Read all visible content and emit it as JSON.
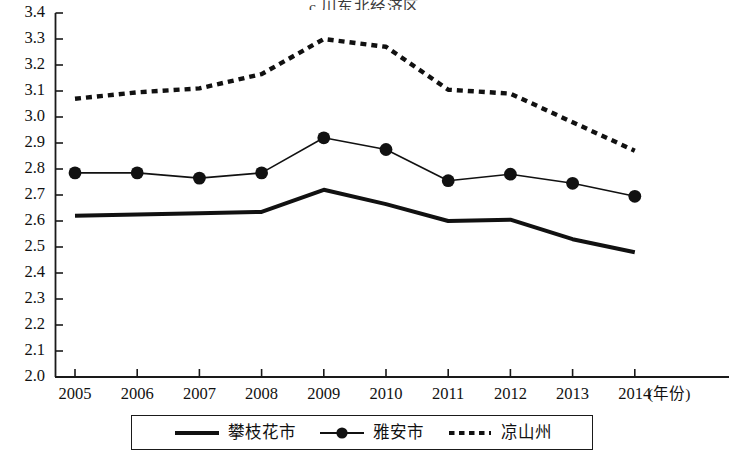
{
  "chart_data": {
    "type": "line",
    "title": "c  川东北经济区",
    "xlabel": "(年份)",
    "ylabel": "",
    "categories": [
      "2005",
      "2006",
      "2007",
      "2008",
      "2009",
      "2010",
      "2011",
      "2012",
      "2013",
      "2014"
    ],
    "x": [
      2005,
      2006,
      2007,
      2008,
      2009,
      2010,
      2011,
      2012,
      2013,
      2014
    ],
    "ylim": [
      2.0,
      3.4
    ],
    "ytick_labels": [
      "3.4",
      "3.3",
      "3.2",
      "3.1",
      "3.0",
      "2.9",
      "2.8",
      "2.7",
      "2.6",
      "2.5",
      "2.4",
      "2.3",
      "2.2",
      "2.1",
      "2.0"
    ],
    "ytick_values": [
      3.4,
      3.3,
      3.2,
      3.1,
      3.0,
      2.9,
      2.8,
      2.7,
      2.6,
      2.5,
      2.4,
      2.3,
      2.2,
      2.1,
      2.0
    ],
    "ytick_step": 0.1,
    "grid": false,
    "legend_position": "bottom",
    "series": [
      {
        "name": "攀枝花市",
        "style": "solid-thick",
        "marker": "none",
        "color": "#111111",
        "values": [
          2.62,
          2.625,
          2.63,
          2.635,
          2.72,
          2.665,
          2.6,
          2.605,
          2.53,
          2.48
        ]
      },
      {
        "name": "雅安市",
        "style": "solid-thin",
        "marker": "filled-circle",
        "color": "#111111",
        "values": [
          2.785,
          2.785,
          2.765,
          2.785,
          2.92,
          2.875,
          2.755,
          2.78,
          2.745,
          2.695
        ]
      },
      {
        "name": "凉山州",
        "style": "dotted",
        "marker": "none",
        "color": "#111111",
        "values": [
          3.07,
          3.095,
          3.11,
          3.165,
          3.3,
          3.27,
          3.105,
          3.09,
          2.98,
          2.87
        ]
      }
    ]
  },
  "legend": {
    "items": [
      {
        "label": "攀枝花市",
        "swatch": "solid-thick-line-swatch"
      },
      {
        "label": "雅安市",
        "swatch": "circle-marker-line-swatch"
      },
      {
        "label": "凉山州",
        "swatch": "dotted-line-swatch"
      }
    ]
  },
  "axes": {
    "x_unit_label": "(年份)"
  }
}
